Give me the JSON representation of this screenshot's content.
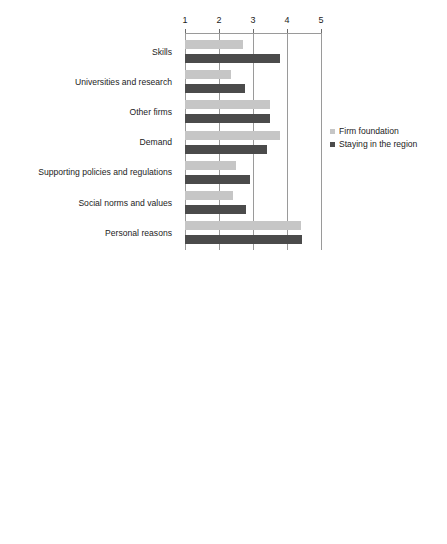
{
  "chart_data": [
    {
      "type": "bar",
      "orientation": "horizontal",
      "title": "",
      "xlabel": "",
      "ylabel": "",
      "xlim": [
        1,
        5
      ],
      "xticks": [
        1,
        2,
        3,
        4,
        5
      ],
      "xtick_labels": [
        "1",
        "2",
        "3",
        "4",
        "5"
      ],
      "grid": true,
      "legend_position": "right",
      "categories": [
        "Skills",
        "Universities and research",
        "Other firms",
        "Demand",
        "Supporting policies and regulations",
        "Social norms and values",
        "Personal reasons"
      ],
      "series": [
        {
          "name": "Firm foundation",
          "color": "#c6c6c6",
          "values": [
            2.7,
            2.35,
            3.5,
            3.8,
            2.5,
            2.4,
            4.4
          ]
        },
        {
          "name": "Staying in the region",
          "color": "#4b4b4b",
          "values": [
            3.8,
            2.75,
            3.5,
            3.4,
            2.9,
            2.8,
            4.45
          ]
        }
      ]
    },
    {
      "type": "bar",
      "orientation": "horizontal",
      "title": "",
      "xlabel": "",
      "ylabel": "",
      "xlim": [
        1,
        5
      ],
      "xticks": [
        1,
        2,
        3,
        4,
        5
      ],
      "xtick_labels": [
        "1",
        "2",
        "3",
        "4",
        "5"
      ],
      "grid": true,
      "legend_position": "right",
      "categories": [
        "Skills",
        "Universities and research",
        "Other firms",
        "Demand",
        "Supporting policiesand regulations",
        "Social norms and values",
        "Personal reasons"
      ],
      "series": [
        {
          "name": "Firm foundation",
          "color": "#c6c6c6",
          "values": [
            3.55,
            2.55,
            3.1,
            3.15,
            2.0,
            2.6,
            4.35
          ]
        },
        {
          "name": "Staying in the region",
          "color": "#4b4b4b",
          "values": [
            4.2,
            2.7,
            3.6,
            3.15,
            2.4,
            2.8,
            4.2
          ]
        }
      ]
    }
  ]
}
